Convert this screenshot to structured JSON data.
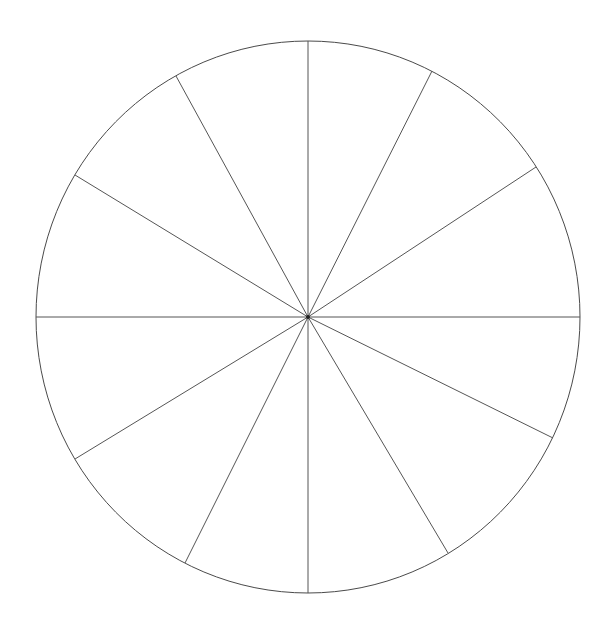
{
  "canvas": {
    "width": 609,
    "height": 629,
    "background_color": "#ffffff"
  },
  "figure": {
    "kind": "circle-sector-diagram",
    "line_color": "#555555",
    "outline_color": "#4a4a4a",
    "outline_width": 1,
    "spoke_width": 1,
    "fill_color": "#ffffff",
    "center_dot_color": "#222222",
    "center_dot_radius": 2
  },
  "chart_data": {
    "type": "pie",
    "title": "",
    "subtitle": "",
    "xlabel": "",
    "ylabel": "",
    "legend": [],
    "annotations": [],
    "grid": false,
    "labels_shown": false,
    "values_shown": false,
    "slice_count": 12,
    "center_x": 308,
    "center_y": 317,
    "radius_x": 272,
    "radius_y": 276,
    "spoke_angles_deg": [
      0,
      33,
      63,
      90,
      119,
      149,
      180,
      211,
      243,
      270,
      301,
      334
    ],
    "categories": [
      "sector-1",
      "sector-2",
      "sector-3",
      "sector-4",
      "sector-5",
      "sector-6",
      "sector-7",
      "sector-8",
      "sector-9",
      "sector-10",
      "sector-11",
      "sector-12"
    ],
    "values": [
      33,
      30,
      27,
      29,
      30,
      31,
      31,
      32,
      27,
      31,
      33,
      26
    ],
    "spokes": [
      {
        "name": "spoke-east",
        "angle_deg": 0,
        "end_x": 580,
        "end_y": 317
      },
      {
        "name": "spoke-ene",
        "angle_deg": 33,
        "end_x": 536,
        "end_y": 167
      },
      {
        "name": "spoke-nne",
        "angle_deg": 63,
        "end_x": 432,
        "end_y": 71
      },
      {
        "name": "spoke-north",
        "angle_deg": 90,
        "end_x": 308,
        "end_y": 41
      },
      {
        "name": "spoke-nnw",
        "angle_deg": 119,
        "end_x": 176,
        "end_y": 76
      },
      {
        "name": "spoke-wnw",
        "angle_deg": 149,
        "end_x": 75,
        "end_y": 175
      },
      {
        "name": "spoke-west",
        "angle_deg": 180,
        "end_x": 36,
        "end_y": 317
      },
      {
        "name": "spoke-wsw",
        "angle_deg": 211,
        "end_x": 75,
        "end_y": 459
      },
      {
        "name": "spoke-ssw",
        "angle_deg": 243,
        "end_x": 185,
        "end_y": 563
      },
      {
        "name": "spoke-south",
        "angle_deg": 270,
        "end_x": 308,
        "end_y": 593
      },
      {
        "name": "spoke-sse",
        "angle_deg": 301,
        "end_x": 448,
        "end_y": 553
      },
      {
        "name": "spoke-ese",
        "angle_deg": 334,
        "end_x": 553,
        "end_y": 438
      }
    ]
  }
}
